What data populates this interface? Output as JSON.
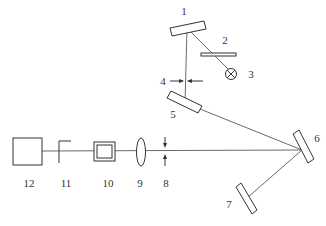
{
  "diagram": {
    "type": "optical-layout",
    "background": "#ffffff",
    "line_color": "#333333",
    "components": [
      {
        "id": "1",
        "label": "1",
        "kind": "mirror"
      },
      {
        "id": "2",
        "label": "2",
        "kind": "plate"
      },
      {
        "id": "3",
        "label": "3",
        "kind": "lamp"
      },
      {
        "id": "4",
        "label": "4",
        "kind": "aperture-arrows"
      },
      {
        "id": "5",
        "label": "5",
        "kind": "mirror"
      },
      {
        "id": "6",
        "label": "6",
        "kind": "mirror"
      },
      {
        "id": "7",
        "label": "7",
        "kind": "mirror"
      },
      {
        "id": "8",
        "label": "8",
        "kind": "aperture-arrows"
      },
      {
        "id": "9",
        "label": "9",
        "kind": "lens"
      },
      {
        "id": "10",
        "label": "10",
        "kind": "sample-cell"
      },
      {
        "id": "11",
        "label": "11",
        "kind": "stop"
      },
      {
        "id": "12",
        "label": "12",
        "kind": "detector-box"
      }
    ]
  }
}
